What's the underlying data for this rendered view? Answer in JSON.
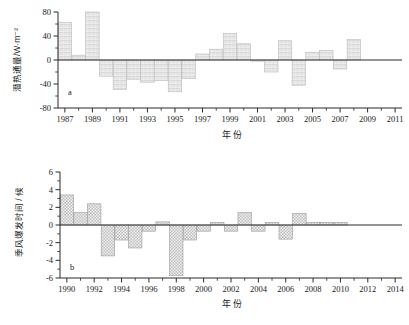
{
  "figure": {
    "panel_a_label": "a",
    "panel_b_label": "b",
    "xlabel_a": "年 份",
    "xlabel_b": "年 份",
    "ylabel_a": "潜热通量/W·m⁻²",
    "ylabel_b": "季风爆发时间 / 候"
  },
  "chart_data": [
    {
      "type": "bar",
      "id": "panel-a",
      "title": "",
      "panel_label": "a",
      "xlabel": "年 份",
      "ylabel": "潜热通量/W·m⁻²",
      "xlim": [
        1986.5,
        2011.5
      ],
      "ylim": [
        -80,
        80
      ],
      "yticks": [
        -80,
        -40,
        0,
        40,
        80
      ],
      "yticklabels": [
        "-80",
        "-40",
        "0",
        "40",
        "80"
      ],
      "yminor_step": 20,
      "xticks": [
        1987,
        1989,
        1991,
        1993,
        1995,
        1997,
        1999,
        2001,
        2003,
        2005,
        2007,
        2009,
        2011
      ],
      "xticklabels": [
        "1987",
        "1989",
        "1991",
        "1993",
        "1995",
        "1997",
        "1999",
        "2001",
        "2003",
        "2005",
        "2007",
        "2009",
        "2011"
      ],
      "xminor_step": 1,
      "grid": false,
      "legend": "none",
      "bar_fill": "#f0f0f0",
      "bar_edge": "#b9b9b9",
      "categories": [
        1987,
        1988,
        1989,
        1990,
        1991,
        1992,
        1993,
        1994,
        1995,
        1996,
        1997,
        1998,
        1999,
        2000,
        2001,
        2002,
        2003,
        2004,
        2005,
        2006,
        2007,
        2008,
        2009
      ],
      "values": [
        63,
        8,
        80,
        -27,
        -49,
        -32,
        -37,
        -34,
        -53,
        -31,
        10,
        18,
        44,
        27,
        -2,
        -20,
        32,
        -42,
        13,
        16,
        -15,
        34,
        0
      ]
    },
    {
      "type": "bar",
      "id": "panel-b",
      "title": "",
      "panel_label": "b",
      "xlabel": "年 份",
      "ylabel": "季风爆发时间 / 候",
      "xlim": [
        1989.5,
        2014.5
      ],
      "ylim": [
        -6,
        6
      ],
      "yticks": [
        -6,
        -4,
        -2,
        0,
        2,
        4,
        6
      ],
      "yticklabels": [
        "-6",
        "-4",
        "-2",
        "0",
        "2",
        "4",
        "6"
      ],
      "yminor_step": 1,
      "xticks": [
        1990,
        1992,
        1994,
        1996,
        1998,
        2000,
        2002,
        2004,
        2006,
        2008,
        2010,
        2012,
        2014
      ],
      "xticklabels": [
        "1990",
        "1992",
        "1994",
        "1996",
        "1998",
        "2000",
        "2002",
        "2004",
        "2006",
        "2008",
        "2010",
        "2012",
        "2014"
      ],
      "xminor_step": 1,
      "grid": false,
      "legend": "none",
      "bar_fill": "#c0c0c0",
      "bar_edge": "#9a9a9a",
      "categories": [
        1990,
        1991,
        1992,
        1993,
        1994,
        1995,
        1996,
        1997,
        1998,
        1999,
        2000,
        2001,
        2002,
        2003,
        2004,
        2005,
        2006,
        2007,
        2008,
        2009,
        2010
      ],
      "values": [
        3.4,
        1.4,
        2.4,
        -3.5,
        -1.7,
        -2.6,
        -0.7,
        0.35,
        -5.7,
        -1.7,
        -0.7,
        0.3,
        -0.7,
        1.4,
        -0.7,
        0.3,
        -1.6,
        1.3,
        0.3,
        0.3,
        0.3
      ]
    }
  ]
}
